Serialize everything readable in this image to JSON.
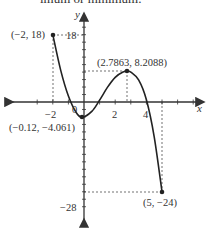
{
  "top_text": "imum or minimum.",
  "chart_data": {
    "type": "line",
    "title": "",
    "xlabel": "x",
    "ylabel": "y",
    "xlim": [
      -3.5,
      7
    ],
    "ylim": [
      -32,
      22
    ],
    "x_tick_labels": [
      "-2",
      "0",
      "2",
      "4"
    ],
    "y_tick_labels": [
      "18",
      "-28"
    ],
    "grid": false,
    "series": [
      {
        "name": "f(x)",
        "domain": [
          -2,
          5
        ],
        "x": [
          -2,
          -1.5,
          -1,
          -0.5,
          -0.12,
          0.5,
          1,
          1.5,
          2,
          2.5,
          2.7863,
          3,
          3.5,
          4,
          4.5,
          5
        ],
        "y": [
          18,
          8.6,
          1.6,
          -2.8,
          -4.061,
          -2.5,
          0.5,
          3.9,
          6.6,
          8.0,
          8.2088,
          8.0,
          5.9,
          0.6,
          -9.3,
          -24
        ]
      }
    ],
    "annotations": [
      {
        "label": "(-2, 18)",
        "x": -2,
        "y": 18,
        "type": "endpoint"
      },
      {
        "label": "(2.7863, 8.2088)",
        "x": 2.7863,
        "y": 8.2088,
        "type": "local maximum"
      },
      {
        "label": "(-0.12, -4.061)",
        "x": -0.12,
        "y": -4.061,
        "type": "local minimum"
      },
      {
        "label": "(5, -24)",
        "x": 5,
        "y": -24,
        "type": "endpoint"
      }
    ]
  }
}
